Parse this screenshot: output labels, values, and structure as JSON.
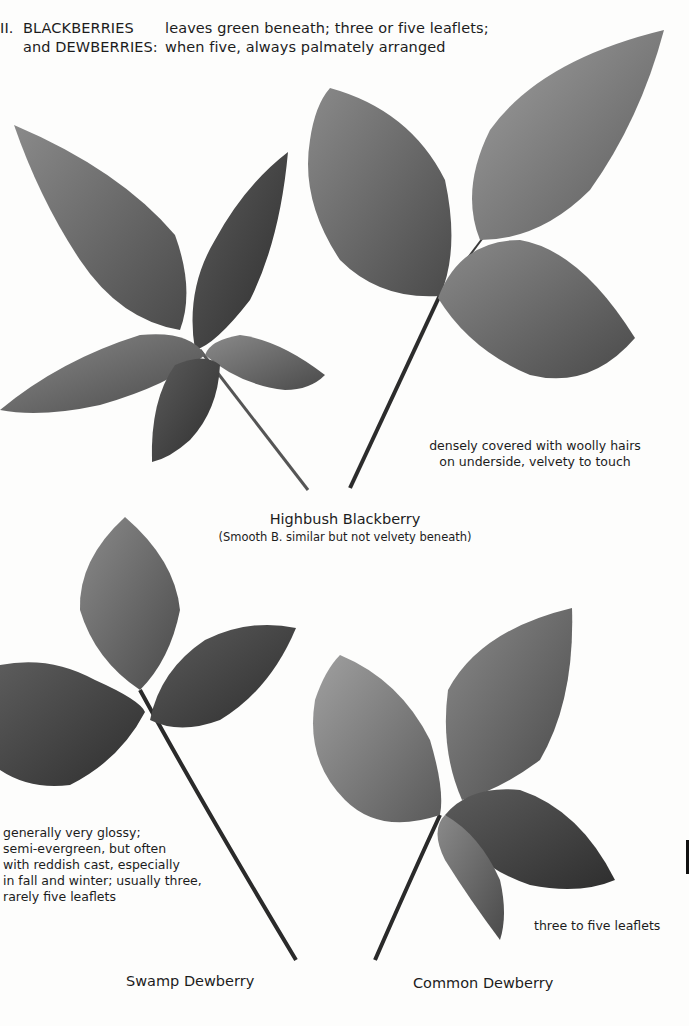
{
  "header": {
    "section_number": "II.",
    "group_line1": "BLACKBERRIES",
    "group_line2": "and  DEWBERRIES:",
    "description_line1": "leaves green beneath; three or five leaflets;",
    "description_line2": "when five, always palmately arranged"
  },
  "plates": [
    {
      "id": "highbush-blackberry",
      "title": "Highbush Blackberry",
      "subtitle": "(Smooth B. similar but not velvety beneath)",
      "note_lines": [
        "densely covered with woolly hairs",
        "on underside, velvety to touch"
      ],
      "leaflets": 5
    },
    {
      "id": "swamp-dewberry",
      "title": "Swamp Dewberry",
      "note_lines": [
        "generally very glossy;",
        "semi-evergreen, but often",
        "with reddish cast, especially",
        "in fall and winter; usually three,",
        "rarely five leaflets"
      ],
      "leaflets": 3
    },
    {
      "id": "common-dewberry",
      "title": "Common Dewberry",
      "note_lines": [
        "three to five leaflets"
      ],
      "leaflets": 5
    }
  ],
  "colors": {
    "background": "#fdfdfc",
    "text": "#1c1c1c",
    "leaf_dark": "#3a3a3a",
    "leaf_mid": "#6a6a6a",
    "leaf_light": "#8f8f8f"
  }
}
